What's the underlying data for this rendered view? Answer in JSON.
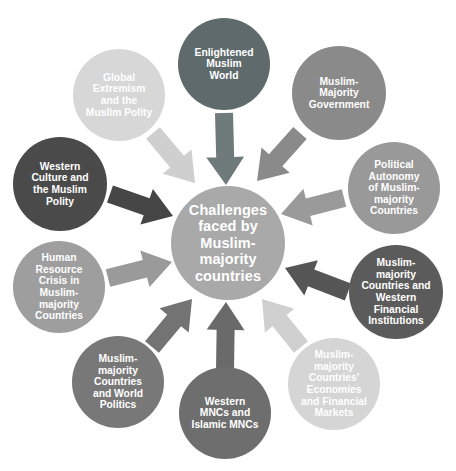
{
  "diagram": {
    "type": "radial-hub-and-spoke",
    "hub": {
      "id": "hub",
      "label": "Challenges\nfaced by\nMuslim-\nmajority\ncountries",
      "color": "#a9a9a9",
      "text_color": "#ffffff",
      "cx": 228,
      "cy": 243,
      "r": 57
    },
    "satellites": [
      {
        "id": "enlightened-muslim-world",
        "label": "Enlightened\nMuslim\nWorld",
        "color": "#5e6a6b",
        "cx": 224,
        "cy": 64,
        "r": 46,
        "angle_deg": 90,
        "arrow": {
          "color": "#6f7a7b",
          "from_x": 224,
          "from_y": 113,
          "to_x": 226,
          "to_y": 185,
          "width": 18
        }
      },
      {
        "id": "muslim-majority-government",
        "label": "Muslim-\nMajority\nGovernment",
        "color": "#8a8a8a",
        "cx": 339,
        "cy": 93,
        "r": 47,
        "angle_deg": 51,
        "arrow": {
          "color": "#8a8a8a",
          "from_x": 300,
          "from_y": 133,
          "to_x": 257,
          "to_y": 181,
          "width": 18
        }
      },
      {
        "id": "political-autonomy",
        "label": "Political\nAutonomy\nof Muslim-\nmajority\nCountries",
        "color": "#999999",
        "cx": 394,
        "cy": 188,
        "r": 46,
        "angle_deg": 14,
        "arrow": {
          "color": "#9a9a9a",
          "from_x": 344,
          "from_y": 198,
          "to_x": 281,
          "to_y": 214,
          "width": 18
        }
      },
      {
        "id": "western-financial-institutions",
        "label": "Muslim-\nmajority\nCountries and\nWestern\nFinancial\nInstitutions",
        "color": "#5b5b5b",
        "cx": 396,
        "cy": 292,
        "r": 47,
        "angle_deg": -19,
        "arrow": {
          "color": "#565656",
          "from_x": 348,
          "from_y": 292,
          "to_x": 285,
          "to_y": 268,
          "width": 18
        }
      },
      {
        "id": "economies-financial-markets",
        "label": "Muslim-\nmajority\nCountries'\nEconomies\nand Financial\nMarkets",
        "color": "#d5d5d5",
        "cx": 334,
        "cy": 384,
        "r": 46,
        "angle_deg": -56,
        "arrow": {
          "color": "#d0d0d0",
          "from_x": 301,
          "from_y": 347,
          "to_x": 262,
          "to_y": 299,
          "width": 18
        }
      },
      {
        "id": "western-mncs-islamic-mncs",
        "label": "Western\nMNCs and\nIslamic MNCs",
        "color": "#6e6e6e",
        "cx": 225,
        "cy": 413,
        "r": 46,
        "angle_deg": -90,
        "arrow": {
          "color": "#6a6a6a",
          "from_x": 225,
          "from_y": 371,
          "to_x": 226,
          "to_y": 302,
          "width": 18
        }
      },
      {
        "id": "countries-world-politics",
        "label": "Muslim-\nmajority\nCountries\nand World\nPolitics",
        "color": "#787878",
        "cx": 118,
        "cy": 382,
        "r": 46,
        "angle_deg": -125,
        "arrow": {
          "color": "#737373",
          "from_x": 152,
          "from_y": 347,
          "to_x": 192,
          "to_y": 299,
          "width": 18
        }
      },
      {
        "id": "human-resource-crisis",
        "label": "Human\nResource\nCrisis in\nMuslim-\nmajority\nCountries",
        "color": "#9e9e9e",
        "cx": 59,
        "cy": 287,
        "r": 46,
        "angle_deg": -163,
        "arrow": {
          "color": "#9a9a9a",
          "from_x": 108,
          "from_y": 278,
          "to_x": 172,
          "to_y": 262,
          "width": 18
        }
      },
      {
        "id": "western-culture-muslim-polity",
        "label": "Western\nCulture and\nthe Muslim\nPolity",
        "color": "#4a4a4a",
        "cx": 60,
        "cy": 184,
        "r": 47,
        "angle_deg": 165,
        "arrow": {
          "color": "#464646",
          "from_x": 110,
          "from_y": 194,
          "to_x": 173,
          "to_y": 216,
          "width": 18
        }
      },
      {
        "id": "global-extremism",
        "label": "Global\nExtremism\nand the\nMuslim Polity",
        "color": "#d7d7d7",
        "cx": 119,
        "cy": 95,
        "r": 46,
        "angle_deg": 128,
        "arrow": {
          "color": "#cfcfcf",
          "from_x": 153,
          "from_y": 133,
          "to_x": 195,
          "to_y": 183,
          "width": 18
        }
      }
    ]
  }
}
